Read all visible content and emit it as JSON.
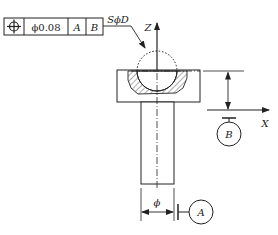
{
  "feature_control_frame": {
    "symbol": "position-icon",
    "tolerance": "ϕ0.08",
    "datum_primary": "A",
    "datum_secondary": "B"
  },
  "leader_label": "SϕD",
  "axes": {
    "z_label": "Z",
    "x_label": "X"
  },
  "datums": {
    "a_label": "A",
    "b_label": "B"
  },
  "shaft_dimension_label": "ϕ",
  "colors": {
    "line": "#222222",
    "background": "#ffffff"
  }
}
